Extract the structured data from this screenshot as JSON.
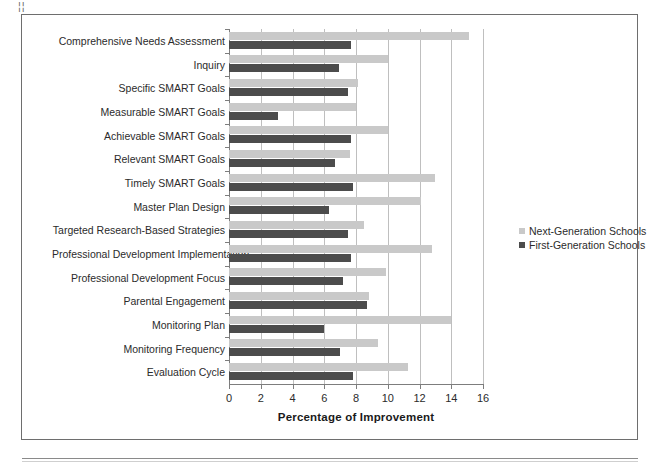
{
  "page": {
    "corner_mark": "¦¦",
    "frame_border_color": "#6e6e6e"
  },
  "legend": {
    "position": "right-middle",
    "items": [
      {
        "label": "Next-Generation Schools",
        "color": "#c9c9c9",
        "swatch_name": "legend-swatch-next-generation"
      },
      {
        "label": "First-Generation Schools",
        "color": "#4c4c4c",
        "swatch_name": "legend-swatch-first-generation"
      }
    ]
  },
  "chart_data": {
    "type": "bar",
    "orientation": "horizontal",
    "title": "",
    "xlabel": "Percentage of Improvement",
    "ylabel": "",
    "xlim": [
      0,
      16
    ],
    "xticks": [
      0,
      2,
      4,
      6,
      8,
      10,
      12,
      14,
      16
    ],
    "xtick_labels": [
      "0",
      "2",
      "4",
      "6",
      "8",
      "10",
      "12",
      "14",
      "16"
    ],
    "grid": "vertical",
    "categories": [
      "Comprehensive Needs Assessment",
      "Inquiry",
      "Specific SMART Goals",
      "Measurable SMART Goals",
      "Achievable SMART Goals",
      "Relevant SMART Goals",
      "Timely SMART Goals",
      "Master Plan Design",
      "Targeted Research-Based Strategies",
      "Professional Development Implementation",
      "Professional Development Focus",
      "Parental Engagement",
      "Monitoring Plan",
      "Monitoring Frequency",
      "Evaluation Cycle"
    ],
    "series": [
      {
        "name": "Next-Generation Schools",
        "color": "#c9c9c9",
        "values": [
          15.1,
          10.0,
          8.1,
          8.0,
          10.0,
          7.6,
          13.0,
          12.1,
          8.5,
          12.8,
          9.9,
          8.8,
          14.0,
          9.4,
          11.3
        ]
      },
      {
        "name": "First-Generation Schools",
        "color": "#4c4c4c",
        "values": [
          7.7,
          6.9,
          7.5,
          3.1,
          7.7,
          6.7,
          7.8,
          6.3,
          7.5,
          7.7,
          7.2,
          8.7,
          6.0,
          7.0,
          7.8
        ]
      }
    ]
  }
}
